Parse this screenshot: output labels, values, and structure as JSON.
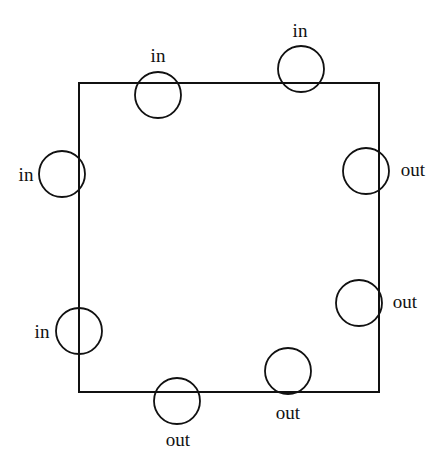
{
  "diagram": {
    "stroke_color": "#111111",
    "square": {
      "x1": 79,
      "y1": 83,
      "x2": 379,
      "y2": 392
    },
    "circles": [
      {
        "id": "top-left",
        "cx": 158,
        "cy": 95,
        "r": 23,
        "label": "in",
        "lx": 158,
        "ly": 62,
        "anchor": "middle"
      },
      {
        "id": "top-right",
        "cx": 301,
        "cy": 69,
        "r": 23,
        "label": "in",
        "lx": 300,
        "ly": 37,
        "anchor": "middle"
      },
      {
        "id": "left-upper",
        "cx": 62,
        "cy": 174,
        "r": 23,
        "label": "in",
        "lx": 26,
        "ly": 181,
        "anchor": "middle"
      },
      {
        "id": "left-lower",
        "cx": 79,
        "cy": 331,
        "r": 23,
        "label": "in",
        "lx": 42,
        "ly": 338,
        "anchor": "middle"
      },
      {
        "id": "right-upper",
        "cx": 366,
        "cy": 171,
        "r": 23,
        "label": "out",
        "lx": 413,
        "ly": 176,
        "anchor": "middle"
      },
      {
        "id": "right-lower",
        "cx": 359,
        "cy": 303,
        "r": 23,
        "label": "out",
        "lx": 405,
        "ly": 308,
        "anchor": "middle"
      },
      {
        "id": "bottom-right",
        "cx": 288,
        "cy": 371,
        "r": 23,
        "label": "out",
        "lx": 288,
        "ly": 419,
        "anchor": "middle"
      },
      {
        "id": "bottom-left",
        "cx": 177,
        "cy": 401,
        "r": 23,
        "label": "out",
        "lx": 178,
        "ly": 446,
        "anchor": "middle"
      }
    ]
  }
}
